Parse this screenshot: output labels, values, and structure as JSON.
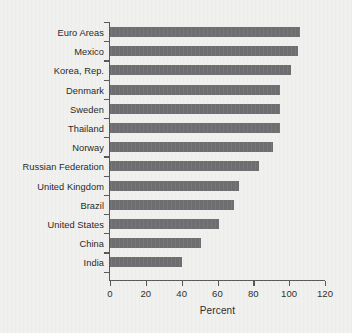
{
  "chart_data": {
    "type": "bar",
    "orientation": "horizontal",
    "title": "",
    "subtitle": "",
    "xlabel": "Percent",
    "ylabel": "",
    "categories": [
      "Euro Areas",
      "Mexico",
      "Korea, Rep.",
      "Denmark",
      "Sweden",
      "Thailand",
      "Norway",
      "Russian Federation",
      "United Kingdom",
      "Brazil",
      "United States",
      "China",
      "India"
    ],
    "values": [
      106,
      105,
      101,
      95,
      95,
      95,
      91,
      83,
      72,
      69,
      61,
      51,
      40
    ],
    "xlim": [
      0,
      120
    ],
    "xticks": [
      0,
      20,
      40,
      60,
      80,
      100,
      120
    ],
    "xtick_labels": [
      "0",
      "20",
      "40",
      "60",
      "80",
      "100",
      "120"
    ],
    "grid": false,
    "legend": false,
    "bar_color": "#6e6e70",
    "background_color": "#f0f0ee",
    "axis_color": "#58585a"
  }
}
